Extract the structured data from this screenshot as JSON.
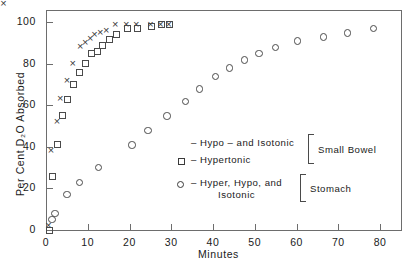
{
  "chart_data": {
    "type": "scatter",
    "title": "",
    "xlabel": "Minutes",
    "ylabel": "Per Cent D2O Absorbed",
    "ylabel_display": "Per Cent D₂O Absorbed",
    "xlim": [
      0,
      85
    ],
    "ylim": [
      0,
      106
    ],
    "xticks": [
      0,
      10,
      20,
      30,
      40,
      50,
      60,
      70,
      80
    ],
    "xticklabels": [
      "0",
      "10",
      "20",
      "30",
      "40",
      "50",
      "60",
      "70",
      "80"
    ],
    "yticks": [
      0,
      20,
      40,
      60,
      80,
      100
    ],
    "yticklabels": [
      "0",
      "20",
      "40",
      "60",
      "80",
      "100"
    ],
    "grid": false,
    "legend_position": "center-right-inside",
    "series": [
      {
        "name": "Hypo - and Isotonic",
        "group": "Small Bowel",
        "marker": "x",
        "points": [
          [
            0.6,
            2
          ],
          [
            1.2,
            38
          ],
          [
            2.6,
            52
          ],
          [
            3.4,
            63
          ],
          [
            5.0,
            72
          ],
          [
            6.4,
            80
          ],
          [
            8.2,
            88
          ],
          [
            9.4,
            90
          ],
          [
            10.6,
            92
          ],
          [
            11.6,
            94
          ],
          [
            13.0,
            95
          ],
          [
            14.4,
            96
          ],
          [
            16.6,
            99
          ],
          [
            19.2,
            99
          ],
          [
            21.6,
            99
          ],
          [
            25.0,
            99
          ],
          [
            27.4,
            99
          ],
          [
            29.4,
            99
          ]
        ]
      },
      {
        "name": "Hypertonic",
        "group": "Small Bowel",
        "marker": "square",
        "points": [
          [
            0.8,
            0
          ],
          [
            1.6,
            26
          ],
          [
            2.8,
            41
          ],
          [
            4.0,
            55
          ],
          [
            5.2,
            63
          ],
          [
            6.6,
            70
          ],
          [
            8.0,
            76
          ],
          [
            9.4,
            80
          ],
          [
            11.0,
            85
          ],
          [
            12.4,
            86
          ],
          [
            13.6,
            89
          ],
          [
            15.2,
            92
          ],
          [
            16.8,
            94
          ],
          [
            19.4,
            97
          ],
          [
            21.8,
            97
          ],
          [
            25.2,
            98
          ],
          [
            27.6,
            99
          ],
          [
            29.6,
            99
          ]
        ]
      },
      {
        "name": "Hyper, Hypo, and Isotonic",
        "group": "Stomach",
        "marker": "circle",
        "points": [
          [
            1.4,
            5
          ],
          [
            2.2,
            8
          ],
          [
            5.0,
            17
          ],
          [
            8.0,
            23
          ],
          [
            12.6,
            30
          ],
          [
            20.6,
            41
          ],
          [
            24.4,
            48
          ],
          [
            29.0,
            55
          ],
          [
            33.4,
            62
          ],
          [
            36.8,
            68
          ],
          [
            40.6,
            74
          ],
          [
            44.0,
            78
          ],
          [
            47.6,
            82
          ],
          [
            51.0,
            85
          ],
          [
            55.0,
            88
          ],
          [
            60.2,
            91
          ],
          [
            66.4,
            93
          ],
          [
            72.2,
            95
          ],
          [
            78.4,
            97
          ]
        ]
      }
    ],
    "legend": [
      {
        "symbol": "x",
        "symbol_name": "x-marker",
        "dash": "–",
        "label": "Hypo – and  Isotonic",
        "group": "Small Bowel"
      },
      {
        "symbol": "square",
        "symbol_name": "square-marker",
        "dash": "–",
        "label": "Hypertonic",
        "group": "Small Bowel"
      },
      {
        "symbol": "circle",
        "symbol_name": "circle-marker",
        "dash": "–",
        "label": "Hyper, Hypo, and",
        "label_line2": "Isotonic",
        "group": "Stomach"
      }
    ],
    "group_labels": [
      "Small Bowel",
      "Stomach"
    ]
  }
}
